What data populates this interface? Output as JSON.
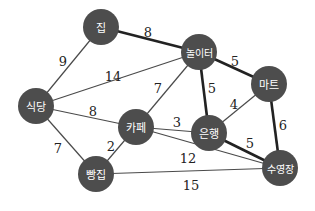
{
  "diagram": {
    "type": "weighted-graph",
    "nodes": [
      {
        "id": "home",
        "label": "집",
        "x": 101,
        "y": 27
      },
      {
        "id": "playground",
        "label": "놀이터",
        "x": 199,
        "y": 52
      },
      {
        "id": "mart",
        "label": "마트",
        "x": 269,
        "y": 84
      },
      {
        "id": "restaurant",
        "label": "식당",
        "x": 36,
        "y": 106
      },
      {
        "id": "cafe",
        "label": "카페",
        "x": 136,
        "y": 127
      },
      {
        "id": "bank",
        "label": "은행",
        "x": 209,
        "y": 133
      },
      {
        "id": "bakery",
        "label": "빵집",
        "x": 96,
        "y": 174
      },
      {
        "id": "pool",
        "label": "수영장",
        "x": 280,
        "y": 168
      }
    ],
    "edges": [
      {
        "from": "home",
        "to": "playground",
        "weight": "8",
        "bold": true,
        "lx": 148,
        "ly": 32
      },
      {
        "from": "home",
        "to": "restaurant",
        "weight": "9",
        "bold": false,
        "lx": 63,
        "ly": 61
      },
      {
        "from": "restaurant",
        "to": "playground",
        "weight": "14",
        "bold": false,
        "lx": 113,
        "ly": 76
      },
      {
        "from": "playground",
        "to": "mart",
        "weight": "5",
        "bold": true,
        "lx": 235,
        "ly": 61
      },
      {
        "from": "playground",
        "to": "cafe",
        "weight": "7",
        "bold": false,
        "lx": 158,
        "ly": 88
      },
      {
        "from": "playground",
        "to": "bank",
        "weight": "5",
        "bold": true,
        "lx": 212,
        "ly": 88
      },
      {
        "from": "mart",
        "to": "bank",
        "weight": "4",
        "bold": false,
        "lx": 234,
        "ly": 104
      },
      {
        "from": "mart",
        "to": "pool",
        "weight": "6",
        "bold": true,
        "lx": 283,
        "ly": 125
      },
      {
        "from": "restaurant",
        "to": "cafe",
        "weight": "8",
        "bold": false,
        "lx": 93,
        "ly": 111
      },
      {
        "from": "cafe",
        "to": "bank",
        "weight": "3",
        "bold": false,
        "lx": 177,
        "ly": 122
      },
      {
        "from": "bank",
        "to": "pool",
        "weight": "5",
        "bold": true,
        "lx": 250,
        "ly": 143
      },
      {
        "from": "restaurant",
        "to": "bakery",
        "weight": "7",
        "bold": false,
        "lx": 58,
        "ly": 148
      },
      {
        "from": "cafe",
        "to": "bakery",
        "weight": "2",
        "bold": false,
        "lx": 111,
        "ly": 146
      },
      {
        "from": "cafe",
        "to": "pool",
        "weight": "12",
        "bold": false,
        "lx": 188,
        "ly": 158
      },
      {
        "from": "bakery",
        "to": "pool",
        "weight": "15",
        "bold": false,
        "lx": 191,
        "ly": 185
      }
    ]
  }
}
